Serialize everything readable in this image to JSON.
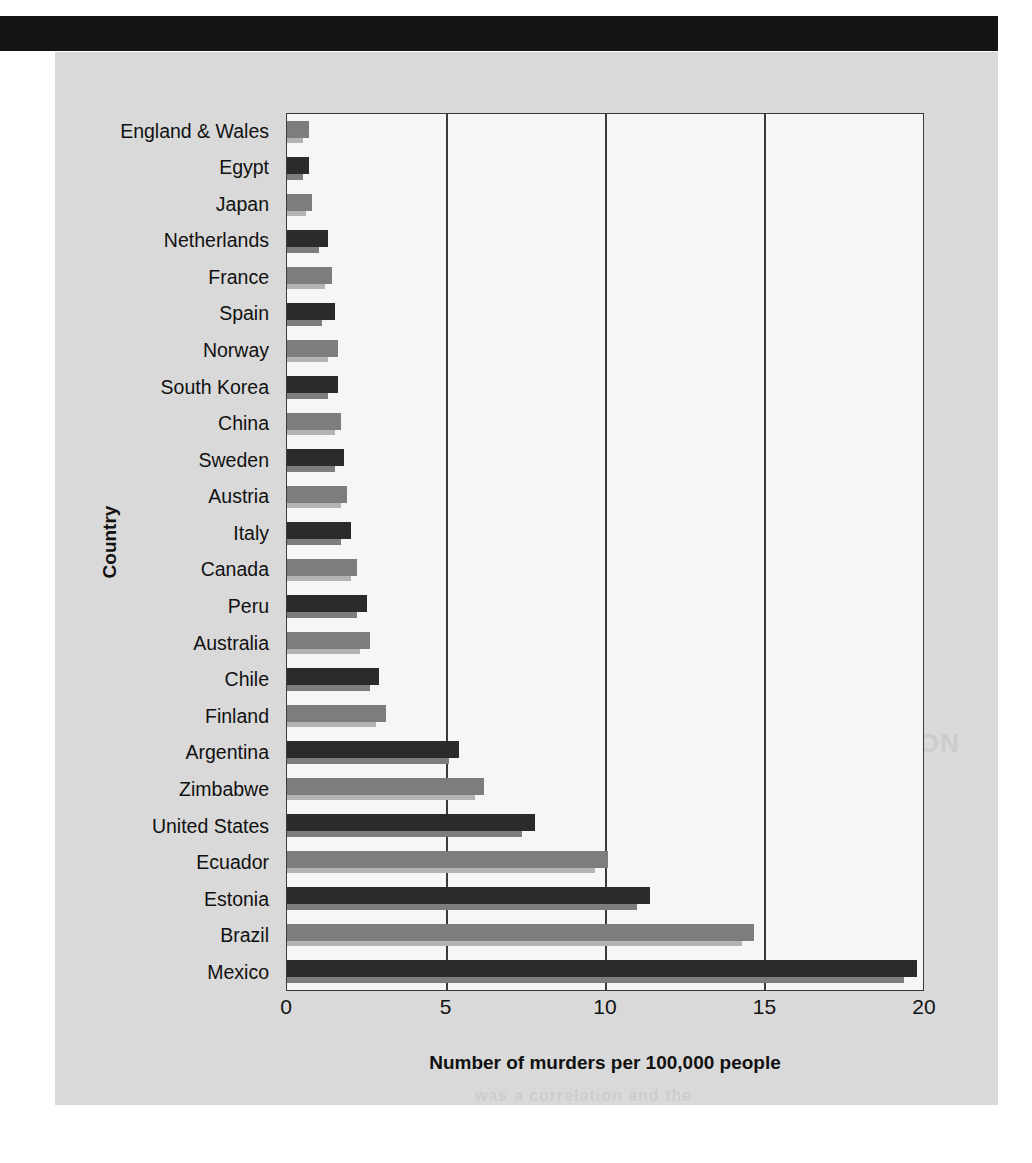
{
  "page": {
    "band_color": "#141414",
    "panel_color": "#d9d9d9"
  },
  "ghost_text": {
    "line1": "METHODS OF INVESTIGATION",
    "line2": "Described more by the way",
    "line3": "The Barrister and its relation",
    "line4": "was a correlation and the"
  },
  "chart_data": {
    "type": "bar",
    "orientation": "horizontal",
    "title": "",
    "xlabel": "Number of murders per 100,000 people",
    "ylabel": "Country",
    "xlim": [
      0,
      20
    ],
    "xticks": [
      "0",
      "5",
      "10",
      "15",
      "20"
    ],
    "xtick_values": [
      0,
      5,
      10,
      15,
      20
    ],
    "grid": "vertical gridlines at 5, 10, 15",
    "legend": "none",
    "bar_colors": {
      "dark": "#2b2b2b",
      "medium": "#7d7d7d",
      "dark_shadow": "#7d7d7d",
      "medium_shadow": "#b3b3b3"
    },
    "categories": [
      "England & Wales",
      "Egypt",
      "Japan",
      "Netherlands",
      "France",
      "Spain",
      "Norway",
      "South Korea",
      "China",
      "Sweden",
      "Austria",
      "Italy",
      "Canada",
      "Peru",
      "Australia",
      "Chile",
      "Finland",
      "Argentina",
      "Zimbabwe",
      "United States",
      "Ecuador",
      "Estonia",
      "Brazil",
      "Mexico"
    ],
    "values": [
      0.7,
      0.7,
      0.8,
      1.3,
      1.4,
      1.5,
      1.6,
      1.6,
      1.7,
      1.8,
      1.9,
      2.0,
      2.2,
      2.5,
      2.6,
      2.9,
      3.1,
      5.4,
      6.2,
      7.8,
      10.1,
      11.4,
      14.7,
      19.8
    ],
    "shadow_values": [
      0.5,
      0.5,
      0.6,
      1.0,
      1.2,
      1.1,
      1.3,
      1.3,
      1.5,
      1.5,
      1.7,
      1.7,
      2.0,
      2.2,
      2.3,
      2.6,
      2.8,
      5.1,
      5.9,
      7.4,
      9.7,
      11.0,
      14.3,
      19.4
    ],
    "shades": [
      "medium",
      "dark",
      "medium",
      "dark",
      "medium",
      "dark",
      "medium",
      "dark",
      "medium",
      "dark",
      "medium",
      "dark",
      "medium",
      "dark",
      "medium",
      "dark",
      "medium",
      "dark",
      "medium",
      "dark",
      "medium",
      "dark",
      "medium",
      "dark"
    ]
  }
}
